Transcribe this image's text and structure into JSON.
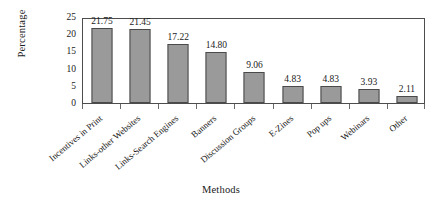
{
  "chart_data": {
    "type": "bar",
    "title": "",
    "xlabel": "Methods",
    "ylabel": "Percentage",
    "ylim": [
      0,
      25
    ],
    "yticks": [
      0,
      5,
      10,
      15,
      20,
      25
    ],
    "grid": false,
    "legend": "none",
    "categories": [
      "Incentives in Print",
      "Links-other Websites",
      "Links-Search Engines",
      "Banners",
      "Discussion Groups",
      "E-Zines",
      "Pop ups",
      "Webinars",
      "Other"
    ],
    "values": [
      21.75,
      21.45,
      17.22,
      14.8,
      9.06,
      4.83,
      4.83,
      3.93,
      2.11
    ],
    "value_labels": [
      "21.75",
      "21.45",
      "17.22",
      "14.80",
      "9.06",
      "4.83",
      "4.83",
      "3.93",
      "2.11"
    ],
    "bar_color": "#9a9a9a",
    "bar_border_color": "#4a4a4a",
    "axis_color": "#4d4d4d"
  }
}
